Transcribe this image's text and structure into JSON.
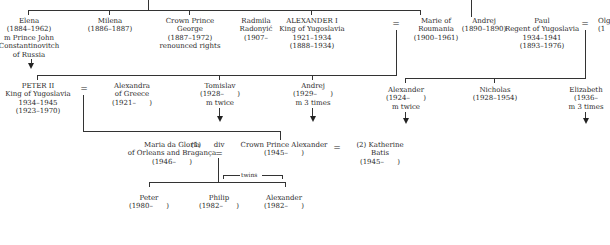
{
  "diagram": {
    "type": "family-tree",
    "generation1": [
      {
        "id": "elena",
        "lines": [
          "Elena",
          "(1884–1962)",
          "m Prince John",
          "Constantinovitch",
          "of Russia"
        ]
      },
      {
        "id": "milena",
        "lines": [
          "Milena",
          "(1886–1887)"
        ]
      },
      {
        "id": "george",
        "lines": [
          "Crown Prince",
          "George",
          "(1887–1972)",
          "renounced rights"
        ]
      },
      {
        "id": "radmila",
        "lines": [
          "Radmila",
          "Radonyić",
          "(1907–"
        ]
      },
      {
        "id": "alexander1",
        "lines": [
          "ALEXANDER I",
          "King of Yugoslavia",
          "1921–1934",
          "(1888–1934)"
        ]
      },
      {
        "id": "marie",
        "lines": [
          "Marie of",
          "Roumania",
          "(1900–1961)"
        ]
      },
      {
        "id": "andrej_elder",
        "lines": [
          "Andrej",
          "(1890–1890)"
        ]
      },
      {
        "id": "paul",
        "lines": [
          "Paul",
          "Regent of Yugoslavia",
          "1934–1941",
          "(1893–1976)"
        ]
      },
      {
        "id": "olga",
        "lines": [
          "Olg",
          "(1"
        ]
      }
    ],
    "generation2": [
      {
        "id": "peter2",
        "lines": [
          "PETER II",
          "King of Yugoslavia",
          "1934–1945",
          "(1923–1970)"
        ]
      },
      {
        "id": "alexandra",
        "lines": [
          "Alexandra",
          "of Greece",
          "(1921–      )"
        ]
      },
      {
        "id": "tomislav",
        "lines": [
          "Tomislav",
          "(1928–      )",
          "m twice"
        ]
      },
      {
        "id": "andrej",
        "lines": [
          "Andrej",
          "(1929–      )",
          "m 3 times"
        ]
      },
      {
        "id": "alexander_p",
        "lines": [
          "Alexander",
          "(1924–      )",
          "m twice"
        ]
      },
      {
        "id": "nicholas",
        "lines": [
          "Nicholas",
          "(1928–1954)"
        ]
      },
      {
        "id": "elizabeth",
        "lines": [
          "Elizabeth",
          "(1936–",
          "m 3 times"
        ]
      }
    ],
    "generation3": [
      {
        "id": "maria",
        "lines": [
          "Maria da Gloria",
          "of Orleans and Bragança",
          "(1946–      )"
        ]
      },
      {
        "id": "first_marker",
        "lines": [
          "(1)"
        ]
      },
      {
        "id": "div_marker",
        "lines": [
          "div"
        ]
      },
      {
        "id": "crown_prince_alexander",
        "lines": [
          "Crown Prince Alexander",
          "(1945–      )"
        ]
      },
      {
        "id": "katherine",
        "lines": [
          "(2) Katherine",
          "Batis",
          "(1945–      )"
        ]
      }
    ],
    "generation4": [
      {
        "id": "peter",
        "lines": [
          "Peter",
          "(1980–      )"
        ]
      },
      {
        "id": "philip",
        "lines": [
          "Philip",
          "(1982–      )"
        ]
      },
      {
        "id": "alexander_c",
        "lines": [
          "Alexander",
          "(1982–      )"
        ]
      }
    ],
    "symbols": {
      "married": "=",
      "twins": "twins"
    }
  }
}
